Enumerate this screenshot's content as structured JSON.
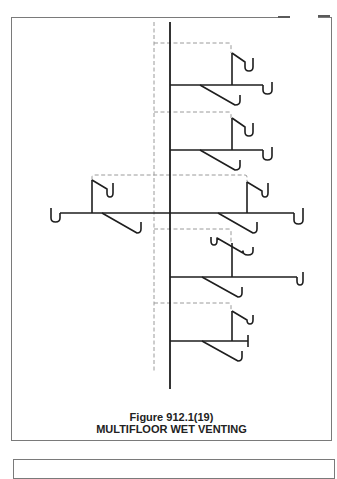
{
  "figure": {
    "number": "Figure 912.1(19)",
    "title": "MULTIFLOOR WET VENTING"
  },
  "colors": {
    "pipe": "#1e1e1e",
    "vent_dashed": "#9a9a9a",
    "frame": "#7a7a7a"
  },
  "diagram": {
    "stack": {
      "x": 170,
      "y1": 22,
      "y2": 389
    },
    "vent_stack": {
      "x": 154,
      "y1": 22,
      "y2": 372
    },
    "vent_connectors": [
      "M154 43 H229 Q231 43 231 45 V53",
      "M154 112 H229 Q231 112 231 114 V118",
      "M92 180 V177 Q92 175 94 175 H245 Q247 175 247 177 V182",
      "M154 229 H229 Q231 229 231 231 V243",
      "M154 303 H229 Q231 303 231 305 V311"
    ],
    "pipes": [
      "M170 85 H263",
      "M232 53 V85",
      "M232 53 L245 62 V67 Q245 71 249 71 Q253 71 253 67 V58",
      "M263 85 V90 Q263 94 267.5 94 Q272 94 272 90 V82",
      "M200 85 L235 105 Q240 105 240 101 V95",
      "M170 150 H263",
      "M232 118 V150",
      "M232 118 L245 127 V132 Q245 136 249 136 Q253 136 253 132 V123",
      "M263 150 V156 Q263 160 267.5 160 Q272 160 272 156 V147",
      "M200 150 L235 170 Q240 170 240 166 V160",
      "M60 213 H294",
      "M92 180 V213",
      "M92 180 L107 189 V193 Q107 197 110 197 Q113 197 113 193 V183",
      "M60 213 V218 Q60 222 55.5 222 Q51 222 51 218 V208",
      "M102 213 L137 233 Q141 233 141 229 V222",
      "M247 182 V213",
      "M247 182 L262 191 V193 Q262 197 265 197 Q268 197 268 193 V183",
      "M294 213 V220 Q294 224 298.5 224 Q303 224 303 220 V208",
      "M218 213 L253 233 Q257 233 257 229 V222",
      "M170 277 H297",
      "M232 243 V277",
      "M211 237 V241 Q211 245 214 245 Q217 245 217 241 V238 L243 253 V251 Q243 255 248 255 Q253 255 253 251 V247",
      "M297 277 V281 Q297 285 300 285 Q303 285 303 281 V272",
      "M202 277 L238 297 Q242 297 242 293 V287",
      "M170 341 H248",
      "M248 335 V347",
      "M232 311 V341",
      "M232 311 L247 320 V320 Q247 324 250 324 Q253 324 253 320 V315",
      "M202 341 L238 361 Q242 361 242 357 V351"
    ]
  }
}
